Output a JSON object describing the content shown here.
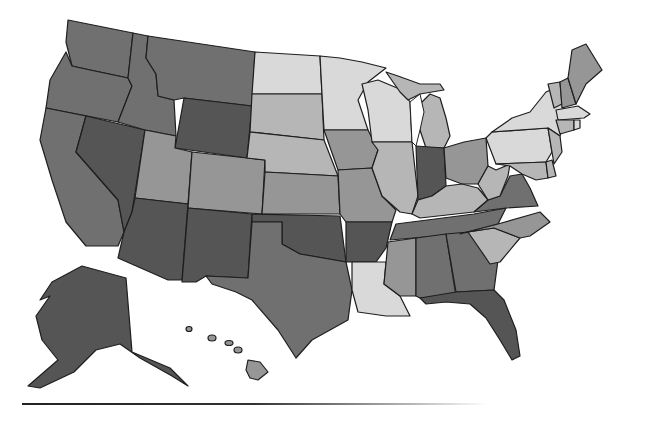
{
  "map": {
    "type": "choropleth",
    "region": "United States",
    "legend_visible": false,
    "title_visible": false,
    "shade_colors": {
      "1": "#d9d9d9",
      "2": "#b6b6b6",
      "3": "#969696",
      "4": "#707070",
      "5": "#555555"
    },
    "stroke_color": "#1e1e1e",
    "states": [
      {
        "code": "WA",
        "shade": 4,
        "points": "68,20 133,33 128,78 100,72 90,70 72,66 66,42"
      },
      {
        "code": "OR",
        "shade": 4,
        "points": "66,52 72,66 90,70 128,78 132,86 118,122 46,108 50,80"
      },
      {
        "code": "CA",
        "shade": 4,
        "points": "46,108 86,116 76,152 118,200 124,232 118,246 86,246 66,222 52,180 40,140"
      },
      {
        "code": "NV",
        "shade": 5,
        "points": "86,116 145,130 132,212 124,232 118,200 76,152"
      },
      {
        "code": "ID",
        "shade": 4,
        "points": "133,33 148,36 146,58 156,74 158,96 174,100 176,136 145,130 118,122 132,86 128,78"
      },
      {
        "code": "MT",
        "shade": 4,
        "points": "148,36 255,52 252,106 184,98 174,100 158,96 156,74 146,58"
      },
      {
        "code": "WY",
        "shade": 5,
        "points": "184,98 252,106 247,158 175,148"
      },
      {
        "code": "UT",
        "shade": 3,
        "points": "145,130 176,136 175,148 192,152 188,204 135,198"
      },
      {
        "code": "AZ",
        "shade": 5,
        "points": "135,198 188,204 182,280 168,280 118,258 124,232 132,212"
      },
      {
        "code": "CO",
        "shade": 3,
        "points": "192,152 265,160 262,214 188,208"
      },
      {
        "code": "NM",
        "shade": 5,
        "points": "188,208 252,214 248,278 206,276 196,282 182,282"
      },
      {
        "code": "ND",
        "shade": 1,
        "points": "255,52 320,56 322,94 252,94"
      },
      {
        "code": "SD",
        "shade": 2,
        "points": "252,94 322,94 324,140 250,132"
      },
      {
        "code": "NE",
        "shade": 2,
        "points": "250,132 324,140 338,176 265,172 265,160 247,158"
      },
      {
        "code": "KS",
        "shade": 3,
        "points": "265,172 338,176 340,214 262,214"
      },
      {
        "code": "OK",
        "shade": 5,
        "points": "252,214 340,216 346,262 300,254 282,244 282,222 252,222"
      },
      {
        "code": "TX",
        "shade": 4,
        "points": "252,222 282,222 282,244 300,254 346,262 352,290 348,320 312,340 296,358 278,330 252,300 236,292 212,284 206,276 248,278"
      },
      {
        "code": "MN",
        "shade": 1,
        "points": "320,56 340,58 362,62 386,68 368,82 358,100 368,130 324,130 322,94"
      },
      {
        "code": "IA",
        "shade": 3,
        "points": "324,130 368,130 378,150 372,168 338,170"
      },
      {
        "code": "MO",
        "shade": 3,
        "points": "338,170 372,168 382,196 396,210 392,222 346,222 340,214"
      },
      {
        "code": "AR",
        "shade": 5,
        "points": "346,222 392,222 386,248 376,262 346,262"
      },
      {
        "code": "LA",
        "shade": 1,
        "points": "352,262 386,262 384,284 400,296 410,316 386,316 358,312 352,290"
      },
      {
        "code": "WI",
        "shade": 1,
        "points": "362,84 378,80 402,90 410,102 412,142 372,142 368,110"
      },
      {
        "code": "IL",
        "shade": 2,
        "points": "372,142 412,142 418,196 412,214 400,212 382,196 372,168 378,150"
      },
      {
        "code": "MI",
        "shade": 2,
        "points": "420,104 430,94 440,98 446,118 450,136 444,148 426,148 420,130"
      },
      {
        "code": "MI-UP",
        "shade": 2,
        "points": "386,72 398,76 420,84 440,84 444,90 420,94 408,100 400,92"
      },
      {
        "code": "IN",
        "shade": 5,
        "points": "416,146 444,148 446,186 432,196 418,200"
      },
      {
        "code": "OH",
        "shade": 3,
        "points": "444,148 464,142 486,138 488,166 478,184 462,184 446,178"
      },
      {
        "code": "KY",
        "shade": 2,
        "points": "412,214 418,200 432,196 446,186 462,184 478,188 488,200 474,212 420,218"
      },
      {
        "code": "TN",
        "shade": 4,
        "points": "396,224 474,214 506,208 498,224 460,234 390,240"
      },
      {
        "code": "MS",
        "shade": 3,
        "points": "388,242 416,238 416,296 400,296 384,284"
      },
      {
        "code": "AL",
        "shade": 4,
        "points": "416,238 446,234 456,296 420,298 416,296"
      },
      {
        "code": "GA",
        "shade": 4,
        "points": "446,234 468,232 498,260 494,290 456,292"
      },
      {
        "code": "FL",
        "shade": 5,
        "points": "420,298 456,292 494,290 504,300 516,330 520,356 512,360 500,340 486,318 470,304 446,302 426,304"
      },
      {
        "code": "SC",
        "shade": 2,
        "points": "468,232 494,228 520,238 500,262 490,264"
      },
      {
        "code": "NC",
        "shade": 3,
        "points": "460,234 498,224 540,212 550,222 530,236 520,238 494,228 468,232"
      },
      {
        "code": "VA",
        "shade": 4,
        "points": "474,212 488,200 500,196 510,176 522,174 530,188 538,206 506,208"
      },
      {
        "code": "WV",
        "shade": 2,
        "points": "478,184 488,166 496,170 510,164 508,176 500,196 488,200"
      },
      {
        "code": "PA",
        "shade": 1,
        "points": "486,138 492,132 548,128 552,152 546,162 496,164"
      },
      {
        "code": "NY",
        "shade": 1,
        "points": "492,132 512,118 530,112 546,92 560,86 566,118 560,136 548,128"
      },
      {
        "code": "MD",
        "shade": 2,
        "points": "496,164 546,162 548,178 536,180 522,174 510,166"
      },
      {
        "code": "DE",
        "shade": 2,
        "points": "546,162 552,160 556,176 548,178"
      },
      {
        "code": "NJ",
        "shade": 2,
        "points": "548,128 560,136 562,152 554,164 552,152"
      },
      {
        "code": "VT",
        "shade": 2,
        "points": "548,84 560,82 562,104 554,108"
      },
      {
        "code": "NH",
        "shade": 3,
        "points": "560,82 568,78 576,104 562,108"
      },
      {
        "code": "ME",
        "shade": 3,
        "points": "568,78 572,50 586,44 602,70 586,84 576,104"
      },
      {
        "code": "MA",
        "shade": 1,
        "points": "556,110 578,106 590,114 584,118 558,120"
      },
      {
        "code": "CT",
        "shade": 2,
        "points": "556,120 574,120 574,130 560,134"
      },
      {
        "code": "RI",
        "shade": 1,
        "points": "574,120 580,120 580,128 574,130"
      },
      {
        "code": "AK",
        "shade": 5,
        "points": "52,282 82,266 126,278 132,352 170,368 188,386 172,376 140,358 120,344 96,350 74,372 40,388 28,386 58,360 42,340 36,316 50,296 40,300"
      },
      {
        "code": "HI",
        "shade": 3,
        "points": "248,360 260,362 268,372 258,380 250,378 246,370"
      }
    ],
    "hawaii_small_islands": [
      {
        "cx": 189,
        "cy": 329,
        "rx": 3,
        "ry": 2.5
      },
      {
        "cx": 212,
        "cy": 338,
        "rx": 4,
        "ry": 3
      },
      {
        "cx": 229,
        "cy": 343,
        "rx": 4,
        "ry": 2.5
      },
      {
        "cx": 238,
        "cy": 350,
        "rx": 4,
        "ry": 3
      }
    ],
    "lakes": [
      {
        "name": "Lake Michigan",
        "points": "410,102 420,94 424,112 420,130 416,146 412,142"
      }
    ]
  },
  "footer": {
    "rule_visible": true
  }
}
